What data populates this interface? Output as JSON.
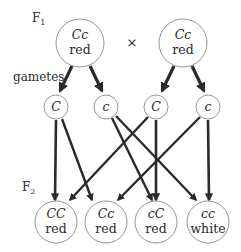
{
  "diagram": {
    "type": "genetic-cross",
    "labels": {
      "f1": "F",
      "f1_sub": "1",
      "f2": "F",
      "f2_sub": "2",
      "gametes": "gametes",
      "cross_symbol": "×"
    },
    "parents": [
      {
        "genotype": "Cc",
        "phenotype": "red"
      },
      {
        "genotype": "Cc",
        "phenotype": "red"
      }
    ],
    "gametes": [
      {
        "allele": "C",
        "parent": 1
      },
      {
        "allele": "c",
        "parent": 1
      },
      {
        "allele": "C",
        "parent": 2
      },
      {
        "allele": "c",
        "parent": 2
      }
    ],
    "offspring": [
      {
        "genotype": "CC",
        "phenotype": "red"
      },
      {
        "genotype": "Cc",
        "phenotype": "red"
      },
      {
        "genotype": "cC",
        "phenotype": "red"
      },
      {
        "genotype": "cc",
        "phenotype": "white"
      }
    ],
    "connections": [
      {
        "from": "gamete-0",
        "to": "offspring-0"
      },
      {
        "from": "gamete-0",
        "to": "offspring-1"
      },
      {
        "from": "gamete-1",
        "to": "offspring-2"
      },
      {
        "from": "gamete-1",
        "to": "offspring-3"
      },
      {
        "from": "gamete-2",
        "to": "offspring-0"
      },
      {
        "from": "gamete-2",
        "to": "offspring-2"
      },
      {
        "from": "gamete-3",
        "to": "offspring-1"
      },
      {
        "from": "gamete-3",
        "to": "offspring-3"
      }
    ]
  }
}
